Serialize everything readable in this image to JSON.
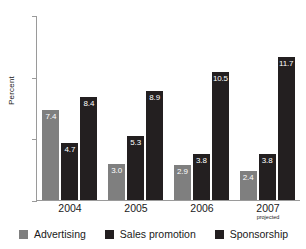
{
  "chart_data": {
    "type": "bar",
    "title": "",
    "xlabel": "",
    "ylabel": "Percent",
    "ylim": [
      0,
      15
    ],
    "yticks": [
      "0",
      "5",
      "10",
      "15"
    ],
    "grid": false,
    "legend_position": "bottom",
    "categories": [
      "2004",
      "2005",
      "2006",
      "2007"
    ],
    "category_sublabels": [
      "",
      "",
      "",
      "projected"
    ],
    "series": [
      {
        "name": "Advertising",
        "color": "#7f7f7f",
        "values": [
          7.4,
          3.0,
          2.9,
          2.4
        ]
      },
      {
        "name": "Sales promotion",
        "color": "#231f20",
        "values": [
          4.7,
          5.3,
          3.8,
          3.8
        ]
      },
      {
        "name": "Sponsorship",
        "color": "#231f20",
        "values": [
          8.4,
          8.9,
          10.5,
          11.7
        ]
      }
    ],
    "value_labels": [
      [
        "7.4",
        "4.7",
        "8.4"
      ],
      [
        "3.0",
        "5.3",
        "8.9"
      ],
      [
        "2.9",
        "3.8",
        "10.5"
      ],
      [
        "2.4",
        "3.8",
        "11.7"
      ]
    ]
  },
  "legend": {
    "items": [
      {
        "label": "Advertising",
        "color": "#7f7f7f"
      },
      {
        "label": "Sales promotion",
        "color": "#231f20"
      },
      {
        "label": "Sponsorship",
        "color": "#231f20"
      }
    ]
  }
}
